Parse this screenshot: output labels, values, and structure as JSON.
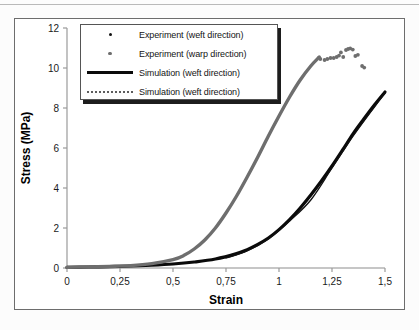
{
  "chart_data": {
    "type": "line",
    "title": "",
    "xlabel": "Strain",
    "ylabel": "Stress (MPa)",
    "xlim": [
      0,
      1.5
    ],
    "ylim": [
      0,
      12
    ],
    "xticks": [
      "0",
      "0,25",
      "0,5",
      "0,75",
      "1",
      "1,25",
      "1,5"
    ],
    "xtick_values": [
      0,
      0.25,
      0.5,
      0.75,
      1,
      1.25,
      1.5
    ],
    "yticks": [
      "0",
      "2",
      "4",
      "6",
      "8",
      "10",
      "12"
    ],
    "ytick_values": [
      0,
      2,
      4,
      6,
      8,
      10,
      12
    ],
    "grid": false,
    "legend_position": "top-left",
    "series": [
      {
        "name": "Experiment (weft direction)",
        "key": "experiment-weft",
        "type": "scatter",
        "marker": "small-dot",
        "color": "#111111",
        "points": []
      },
      {
        "name": "Experiment (warp direction)",
        "key": "experiment-warp",
        "type": "scatter",
        "marker": "small-square",
        "color": "#6e6e6e",
        "points": [
          [
            1.195,
            10.45
          ],
          [
            1.215,
            10.4
          ],
          [
            1.228,
            10.45
          ],
          [
            1.243,
            10.5
          ],
          [
            1.258,
            10.5
          ],
          [
            1.272,
            10.55
          ],
          [
            1.283,
            10.62
          ],
          [
            1.292,
            10.78
          ],
          [
            1.303,
            10.55
          ],
          [
            1.316,
            10.9
          ],
          [
            1.326,
            10.95
          ],
          [
            1.336,
            10.98
          ],
          [
            1.348,
            10.92
          ],
          [
            1.36,
            10.6
          ],
          [
            1.372,
            10.66
          ],
          [
            1.392,
            10.1
          ],
          [
            1.402,
            10.02
          ]
        ]
      },
      {
        "name": "Simulation (weft direction)",
        "key": "simulation-weft-solid",
        "type": "line",
        "style": "solid",
        "color": "#0a0a0a",
        "x": [
          0,
          0.1,
          0.2,
          0.3,
          0.4,
          0.5,
          0.6,
          0.7,
          0.8,
          0.85,
          0.9,
          0.95,
          1.0,
          1.05,
          1.1,
          1.15,
          1.2,
          1.25,
          1.3,
          1.35,
          1.4,
          1.45,
          1.5
        ],
        "y": [
          0.03,
          0.05,
          0.07,
          0.1,
          0.14,
          0.2,
          0.3,
          0.45,
          0.72,
          0.92,
          1.18,
          1.5,
          1.92,
          2.42,
          3.0,
          3.65,
          4.35,
          5.1,
          5.9,
          6.72,
          7.45,
          8.15,
          8.8
        ]
      },
      {
        "name": "Simulation (weft direction)",
        "key": "simulation-warp-dotted",
        "type": "line",
        "style": "dotted",
        "color": "#6e6e6e",
        "x": [
          0,
          0.1,
          0.2,
          0.3,
          0.4,
          0.5,
          0.55,
          0.6,
          0.65,
          0.7,
          0.75,
          0.8,
          0.85,
          0.9,
          0.95,
          1.0,
          1.05,
          1.1,
          1.15,
          1.19
        ],
        "y": [
          0.03,
          0.05,
          0.08,
          0.12,
          0.22,
          0.42,
          0.62,
          0.95,
          1.4,
          2.0,
          2.75,
          3.6,
          4.55,
          5.55,
          6.6,
          7.6,
          8.55,
          9.4,
          10.1,
          10.55
        ]
      },
      {
        "name": "Simulation (weft direction) secondary",
        "key": "simulation-weft-thin",
        "type": "line",
        "style": "solid-thin",
        "color": "#111111",
        "x": [
          0.75,
          0.85,
          0.95,
          1.05,
          1.15,
          1.25,
          1.35,
          1.45,
          1.5
        ],
        "y": [
          0.5,
          0.85,
          1.45,
          2.35,
          3.4,
          5.0,
          6.6,
          8.05,
          8.75
        ]
      }
    ]
  },
  "legend": {
    "items": [
      {
        "label": "Experiment (weft direction)",
        "key_type": "dot-dark"
      },
      {
        "label": "Experiment (warp direction)",
        "key_type": "dot-gray"
      },
      {
        "label": "Simulation (weft direction)",
        "key_type": "line-solid"
      },
      {
        "label": "Simulation (weft direction)",
        "key_type": "line-dash"
      }
    ]
  },
  "axes": {
    "x_title": "Strain",
    "y_title": "Stress (MPa)"
  }
}
